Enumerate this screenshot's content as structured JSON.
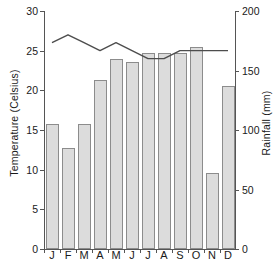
{
  "axes": {
    "y_left_title": "Temperature (Celsius)",
    "y_right_title": "Rainfall (mm)",
    "y_left_ticks": [
      "0",
      "5",
      "10",
      "15",
      "20",
      "25",
      "30"
    ],
    "y_right_ticks": [
      "0",
      "50",
      "100",
      "150",
      "200"
    ],
    "x_ticks": [
      "J",
      "F",
      "M",
      "A",
      "M",
      "J",
      "J",
      "A",
      "S",
      "O",
      "N",
      "D"
    ]
  },
  "chart_data": {
    "type": "bar",
    "title": "",
    "xlabel": "",
    "ylabel": "Temperature (Celsius)",
    "y2label": "Rainfall (mm)",
    "ylim": [
      0,
      30
    ],
    "y2lim": [
      0,
      200
    ],
    "grid": false,
    "legend": "none",
    "categories": [
      "J",
      "F",
      "M",
      "A",
      "M",
      "J",
      "J",
      "A",
      "S",
      "O",
      "N",
      "D"
    ],
    "series": [
      {
        "name": "Rainfall (mm)",
        "type": "bar",
        "axis": "right",
        "unit": "mm",
        "values": [
          105,
          85,
          105,
          142,
          160,
          157,
          165,
          165,
          165,
          170,
          64,
          137
        ]
      },
      {
        "name": "Temperature (Celsius)",
        "type": "line",
        "axis": "left",
        "unit": "C",
        "values": [
          26.0,
          27.0,
          26.0,
          25.0,
          26.0,
          25.0,
          24.0,
          24.0,
          25.0,
          25.0,
          25.0,
          25.0
        ]
      }
    ]
  },
  "style": {
    "bar_fill": "#dcdcdc",
    "bar_stroke": "#8c8c8c",
    "line_color": "#4d4d4d",
    "axis_color": "#555555",
    "text_color": "#1a1a1a",
    "background": "#ffffff"
  }
}
